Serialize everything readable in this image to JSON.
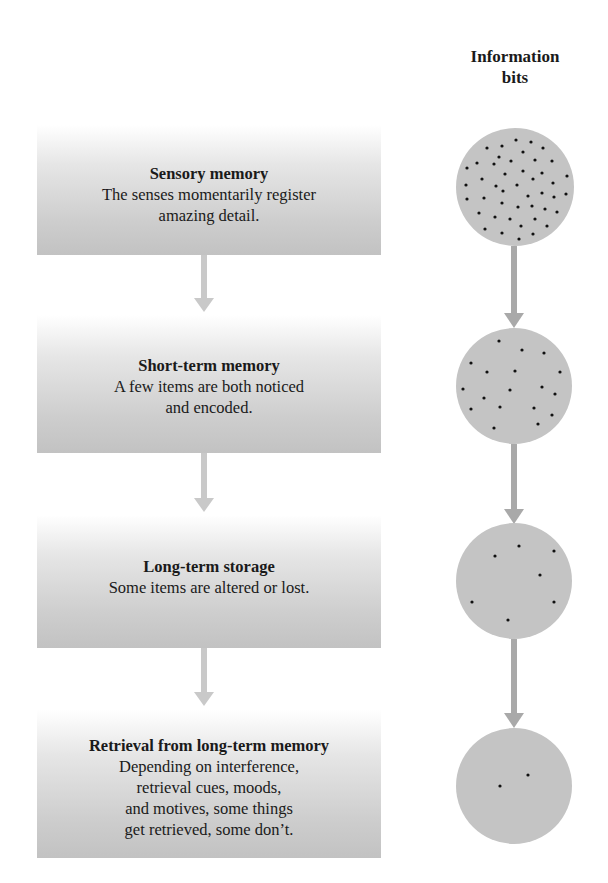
{
  "header": {
    "line1": "Information",
    "line2": "bits"
  },
  "stages": [
    {
      "title": "Sensory memory",
      "desc": "The senses momentarily register\namazing detail."
    },
    {
      "title": "Short-term memory",
      "desc": "A few items are both noticed\nand encoded."
    },
    {
      "title": "Long-term storage",
      "desc": "Some items are altered or lost."
    },
    {
      "title": "Retrieval from long-term memory",
      "desc": "Depending on interference,\nretrieval cues, moods,\nand motives, some things\nget retrieved, some don’t."
    }
  ],
  "colors": {
    "circle_fill": "#c4c4c4",
    "dot": "#111111",
    "left_arrow": "#c9c9c9",
    "right_arrow": "#a9a9a9"
  },
  "circles": [
    {
      "stage": "Sensory memory",
      "cx": 515,
      "cy": 187,
      "r": 59,
      "dot_count": 45,
      "dots": [
        [
          516,
          140
        ],
        [
          531,
          142
        ],
        [
          502,
          146
        ],
        [
          487,
          148
        ],
        [
          543,
          148
        ],
        [
          499,
          157
        ],
        [
          523,
          152
        ],
        [
          511,
          161
        ],
        [
          535,
          160
        ],
        [
          552,
          161
        ],
        [
          477,
          163
        ],
        [
          494,
          164
        ],
        [
          467,
          168
        ],
        [
          523,
          171
        ],
        [
          505,
          174
        ],
        [
          542,
          173
        ],
        [
          567,
          176
        ],
        [
          482,
          179
        ],
        [
          533,
          179
        ],
        [
          466,
          185
        ],
        [
          496,
          186
        ],
        [
          517,
          185
        ],
        [
          553,
          183
        ],
        [
          503,
          191
        ],
        [
          542,
          193
        ],
        [
          566,
          194
        ],
        [
          467,
          199
        ],
        [
          484,
          198
        ],
        [
          528,
          196
        ],
        [
          554,
          197
        ],
        [
          502,
          203
        ],
        [
          532,
          206
        ],
        [
          518,
          207
        ],
        [
          545,
          209
        ],
        [
          557,
          212
        ],
        [
          479,
          213
        ],
        [
          495,
          217
        ],
        [
          510,
          219
        ],
        [
          535,
          219
        ],
        [
          521,
          226
        ],
        [
          547,
          226
        ],
        [
          485,
          229
        ],
        [
          502,
          233
        ],
        [
          533,
          234
        ],
        [
          519,
          239
        ]
      ]
    },
    {
      "stage": "Short-term memory",
      "cx": 514,
      "cy": 386,
      "r": 58,
      "dot_count": 18,
      "dots": [
        [
          499,
          341
        ],
        [
          522,
          350
        ],
        [
          544,
          353
        ],
        [
          471,
          363
        ],
        [
          487,
          372
        ],
        [
          515,
          371
        ],
        [
          560,
          372
        ],
        [
          463,
          389
        ],
        [
          510,
          390
        ],
        [
          542,
          387
        ],
        [
          555,
          394
        ],
        [
          484,
          398
        ],
        [
          500,
          407
        ],
        [
          534,
          408
        ],
        [
          471,
          409
        ],
        [
          552,
          415
        ],
        [
          538,
          424
        ],
        [
          494,
          428
        ]
      ]
    },
    {
      "stage": "Long-term storage",
      "cx": 514,
      "cy": 581,
      "r": 58,
      "dot_count": 7,
      "dots": [
        [
          519,
          546
        ],
        [
          495,
          556
        ],
        [
          554,
          551
        ],
        [
          540,
          575
        ],
        [
          472,
          602
        ],
        [
          554,
          602
        ],
        [
          508,
          620
        ]
      ]
    },
    {
      "stage": "Retrieval from long-term memory",
      "cx": 514,
      "cy": 786,
      "r": 58,
      "dot_count": 2,
      "dots": [
        [
          500,
          786
        ],
        [
          528,
          775
        ]
      ]
    }
  ]
}
